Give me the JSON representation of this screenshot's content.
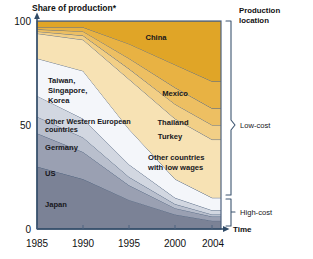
{
  "chart_data": {
    "type": "area",
    "title": "Share of production*",
    "xlabel": "Time",
    "ylabel": "Share of production*",
    "ylim": [
      0,
      100
    ],
    "yticks": [
      0,
      50,
      100
    ],
    "ytick_labels": [
      "0",
      "50",
      "100"
    ],
    "x": [
      1985,
      1990,
      1995,
      2000,
      2004
    ],
    "xtick_labels": [
      "1985",
      "1990",
      "1995",
      "2000",
      "2004"
    ],
    "grid": false,
    "stacked": true,
    "legend_position": "right-inline",
    "legend_title": "Production location",
    "series": [
      {
        "name": "Japan",
        "group": "High-cost",
        "color": "#7b8296",
        "values": [
          30,
          24,
          14,
          7,
          4
        ]
      },
      {
        "name": "US",
        "group": "High-cost",
        "color": "#9aa0b2",
        "values": [
          16,
          13,
          7,
          3,
          2
        ]
      },
      {
        "name": "Germany",
        "group": "High-cost",
        "color": "#b9bfcd",
        "values": [
          8,
          7,
          4,
          2,
          1
        ]
      },
      {
        "name": "Other Western European countries",
        "group": "High-cost",
        "color": "#d2d7e1",
        "values": [
          10,
          9,
          6,
          3,
          2
        ]
      },
      {
        "name": "Taiwan, Singapore, Korea",
        "group": "Low-cost",
        "color": "#f4f6fa",
        "values": [
          18,
          23,
          17,
          9,
          6
        ]
      },
      {
        "name": "Other countries with low wages",
        "group": "Low-cost",
        "color": "#f7e2b4",
        "values": [
          12,
          15,
          24,
          29,
          28
        ]
      },
      {
        "name": "Turkey",
        "group": "Low-cost",
        "color": "#f2cf86",
        "values": [
          1,
          2,
          5,
          7,
          7
        ]
      },
      {
        "name": "Thailand",
        "group": "Low-cost",
        "color": "#edbf62",
        "values": [
          1,
          2,
          5,
          8,
          8
        ]
      },
      {
        "name": "Mexico",
        "group": "Low-cost",
        "color": "#e8b243",
        "values": [
          1,
          2,
          7,
          11,
          13
        ]
      },
      {
        "name": "China",
        "group": "Low-cost",
        "color": "#e0a527",
        "values": [
          3,
          3,
          11,
          21,
          29
        ]
      }
    ],
    "bracket_groups": [
      {
        "label": "Low-cost",
        "from_pct": 20,
        "to_pct": 100
      },
      {
        "label": "High-cost",
        "from_pct": 0,
        "to_pct": 20
      }
    ],
    "footnote_marker": "*"
  },
  "axis": {
    "y_title": "Share of production*",
    "x_title": "Time",
    "y_ticks": [
      "100",
      "50",
      "0"
    ],
    "x_ticks": [
      "1985",
      "1990",
      "1995",
      "2000",
      "2004"
    ]
  },
  "legend": {
    "header_line1": "Production",
    "header_line2": "location",
    "low_cost": "Low-cost",
    "high_cost": "High-cost"
  },
  "band_labels": {
    "china": "China",
    "mexico": "Mexico",
    "thailand": "Thailand",
    "turkey": "Turkey",
    "other_low_wages_line1": "Other countries",
    "other_low_wages_line2": "with low wages",
    "taiwan_line1": "Taiwan,",
    "taiwan_line2": "Singapore,",
    "taiwan_line3": "Korea",
    "other_weur_line1": "Other Western European",
    "other_weur_line2": "countries",
    "germany": "Germany",
    "us": "US",
    "japan": "Japan"
  }
}
